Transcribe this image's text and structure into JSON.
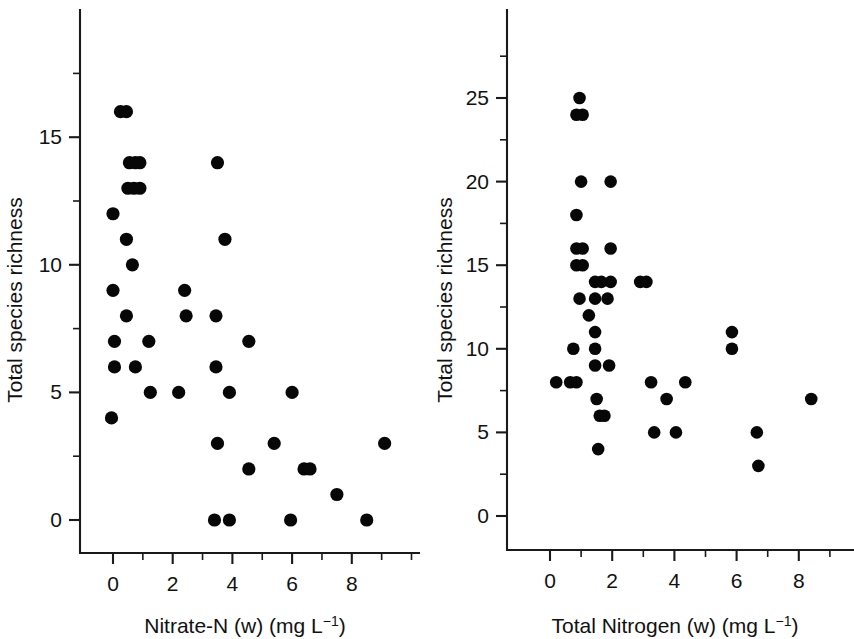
{
  "figure": {
    "background": "#ffffff",
    "point_color": "#070707",
    "axis_color": "#1a1a1a"
  },
  "chart_data": [
    {
      "type": "scatter",
      "title": "",
      "panel": "left",
      "xlabel": "Nitrate-N (w) (mg L⁻¹)",
      "xlabel_main": "Nitrate-N (w) (mg L",
      "xlabel_sup": "−1",
      "xlabel_tail": ")",
      "ylabel": "Total species richness",
      "xlim": [
        -0.65,
        10.2
      ],
      "ylim": [
        -1.4,
        18.1
      ],
      "xticks": [
        0,
        2,
        4,
        6,
        8
      ],
      "xticklabels": [
        "0",
        "2",
        "4",
        "6",
        "8"
      ],
      "xminorticks": [
        1,
        3,
        5,
        7,
        9,
        10
      ],
      "yticks": [
        0,
        5,
        10,
        15
      ],
      "yticklabels": [
        "0",
        "5",
        "10",
        "15"
      ],
      "yminorticks": [
        2.5,
        7.5,
        12.5,
        17.5
      ],
      "grid": false,
      "legend": "none",
      "marker": "filled-circle",
      "points": [
        [
          0.25,
          16
        ],
        [
          0.45,
          16
        ],
        [
          0.55,
          14
        ],
        [
          0.75,
          14
        ],
        [
          0.9,
          14
        ],
        [
          3.5,
          14
        ],
        [
          0.5,
          13
        ],
        [
          0.7,
          13
        ],
        [
          0.9,
          13
        ],
        [
          0.0,
          12
        ],
        [
          0.45,
          11
        ],
        [
          3.75,
          11
        ],
        [
          0.65,
          10
        ],
        [
          0.0,
          9
        ],
        [
          2.4,
          9
        ],
        [
          0.45,
          8
        ],
        [
          2.45,
          8
        ],
        [
          3.45,
          8
        ],
        [
          0.05,
          7
        ],
        [
          1.2,
          7
        ],
        [
          4.55,
          7
        ],
        [
          0.05,
          6
        ],
        [
          0.75,
          6
        ],
        [
          3.45,
          6
        ],
        [
          1.25,
          5
        ],
        [
          2.2,
          5
        ],
        [
          3.9,
          5
        ],
        [
          6.0,
          5
        ],
        [
          -0.05,
          4
        ],
        [
          3.5,
          3
        ],
        [
          5.4,
          3
        ],
        [
          9.1,
          3
        ],
        [
          4.55,
          2
        ],
        [
          6.4,
          2
        ],
        [
          6.6,
          2
        ],
        [
          7.5,
          1
        ],
        [
          3.4,
          0
        ],
        [
          3.9,
          0
        ],
        [
          5.95,
          0
        ],
        [
          8.5,
          0
        ]
      ]
    },
    {
      "type": "scatter",
      "title": "",
      "panel": "right",
      "xlabel": "Total Nitrogen (w) (mg L⁻¹)",
      "xlabel_main": "Total Nitrogen (w) (mg L",
      "xlabel_sup": "−1",
      "xlabel_tail": ")",
      "ylabel": "Total species richness",
      "xlim": [
        -0.6,
        9.6
      ],
      "ylim": [
        -2.1,
        30.3
      ],
      "xticks": [
        0,
        2,
        4,
        6,
        8
      ],
      "xticklabels": [
        "0",
        "2",
        "4",
        "6",
        "8"
      ],
      "xminorticks": [
        1,
        3,
        5,
        7,
        9
      ],
      "yticks": [
        0,
        5,
        10,
        15,
        20,
        25
      ],
      "yticklabels": [
        "0",
        "5",
        "10",
        "15",
        "20",
        "25"
      ],
      "yminorticks": [
        2.5,
        7.5,
        12.5,
        17.5,
        22.5,
        27.5
      ],
      "grid": false,
      "legend": "none",
      "marker": "filled-circle",
      "points": [
        [
          0.95,
          25
        ],
        [
          0.85,
          24
        ],
        [
          1.05,
          24
        ],
        [
          1.0,
          20
        ],
        [
          1.95,
          20
        ],
        [
          0.85,
          18
        ],
        [
          0.85,
          16
        ],
        [
          1.05,
          16
        ],
        [
          1.95,
          16
        ],
        [
          0.85,
          15
        ],
        [
          1.05,
          15
        ],
        [
          1.45,
          14
        ],
        [
          1.65,
          14
        ],
        [
          1.95,
          14
        ],
        [
          2.9,
          14
        ],
        [
          3.1,
          14
        ],
        [
          0.95,
          13
        ],
        [
          1.45,
          13
        ],
        [
          1.85,
          13
        ],
        [
          1.25,
          12
        ],
        [
          1.45,
          11
        ],
        [
          5.85,
          11
        ],
        [
          0.75,
          10
        ],
        [
          1.45,
          10
        ],
        [
          5.85,
          10
        ],
        [
          1.45,
          9
        ],
        [
          1.9,
          9
        ],
        [
          0.2,
          8
        ],
        [
          0.65,
          8
        ],
        [
          0.85,
          8
        ],
        [
          3.25,
          8
        ],
        [
          4.35,
          8
        ],
        [
          1.5,
          7
        ],
        [
          3.75,
          7
        ],
        [
          8.4,
          7
        ],
        [
          1.6,
          6
        ],
        [
          1.75,
          6
        ],
        [
          3.35,
          5
        ],
        [
          4.05,
          5
        ],
        [
          6.65,
          5
        ],
        [
          1.55,
          4
        ],
        [
          6.7,
          3
        ]
      ]
    }
  ]
}
